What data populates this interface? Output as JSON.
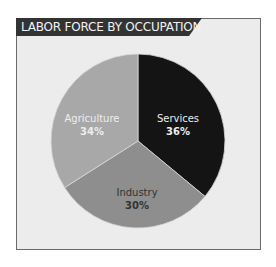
{
  "chart_data": {
    "type": "pie",
    "title": "LABOR FORCE BY OCCUPATION",
    "categories": [
      "Services",
      "Industry",
      "Agriculture"
    ],
    "values": [
      36,
      30,
      34
    ],
    "unit": "%",
    "labels": [
      "36%",
      "30%",
      "34%"
    ],
    "colors": [
      "#141414",
      "#8e8e8e",
      "#a8a8a8"
    ],
    "start_angle": "12 o'clock",
    "direction": "clockwise",
    "legend": "none (labels inside slices)"
  },
  "header": {
    "title": "LABOR FORCE BY OCCUPATION",
    "background": "#333333",
    "text_color": "#f2f2f2"
  },
  "slices": [
    {
      "name": "Services",
      "pct": "36%",
      "color": "#141414"
    },
    {
      "name": "Industry",
      "pct": "30%",
      "color": "#8e8e8e"
    },
    {
      "name": "Agriculture",
      "pct": "34%",
      "color": "#a8a8a8"
    }
  ],
  "frame": {
    "background": "#ececec",
    "border": "#6a6a6a"
  }
}
